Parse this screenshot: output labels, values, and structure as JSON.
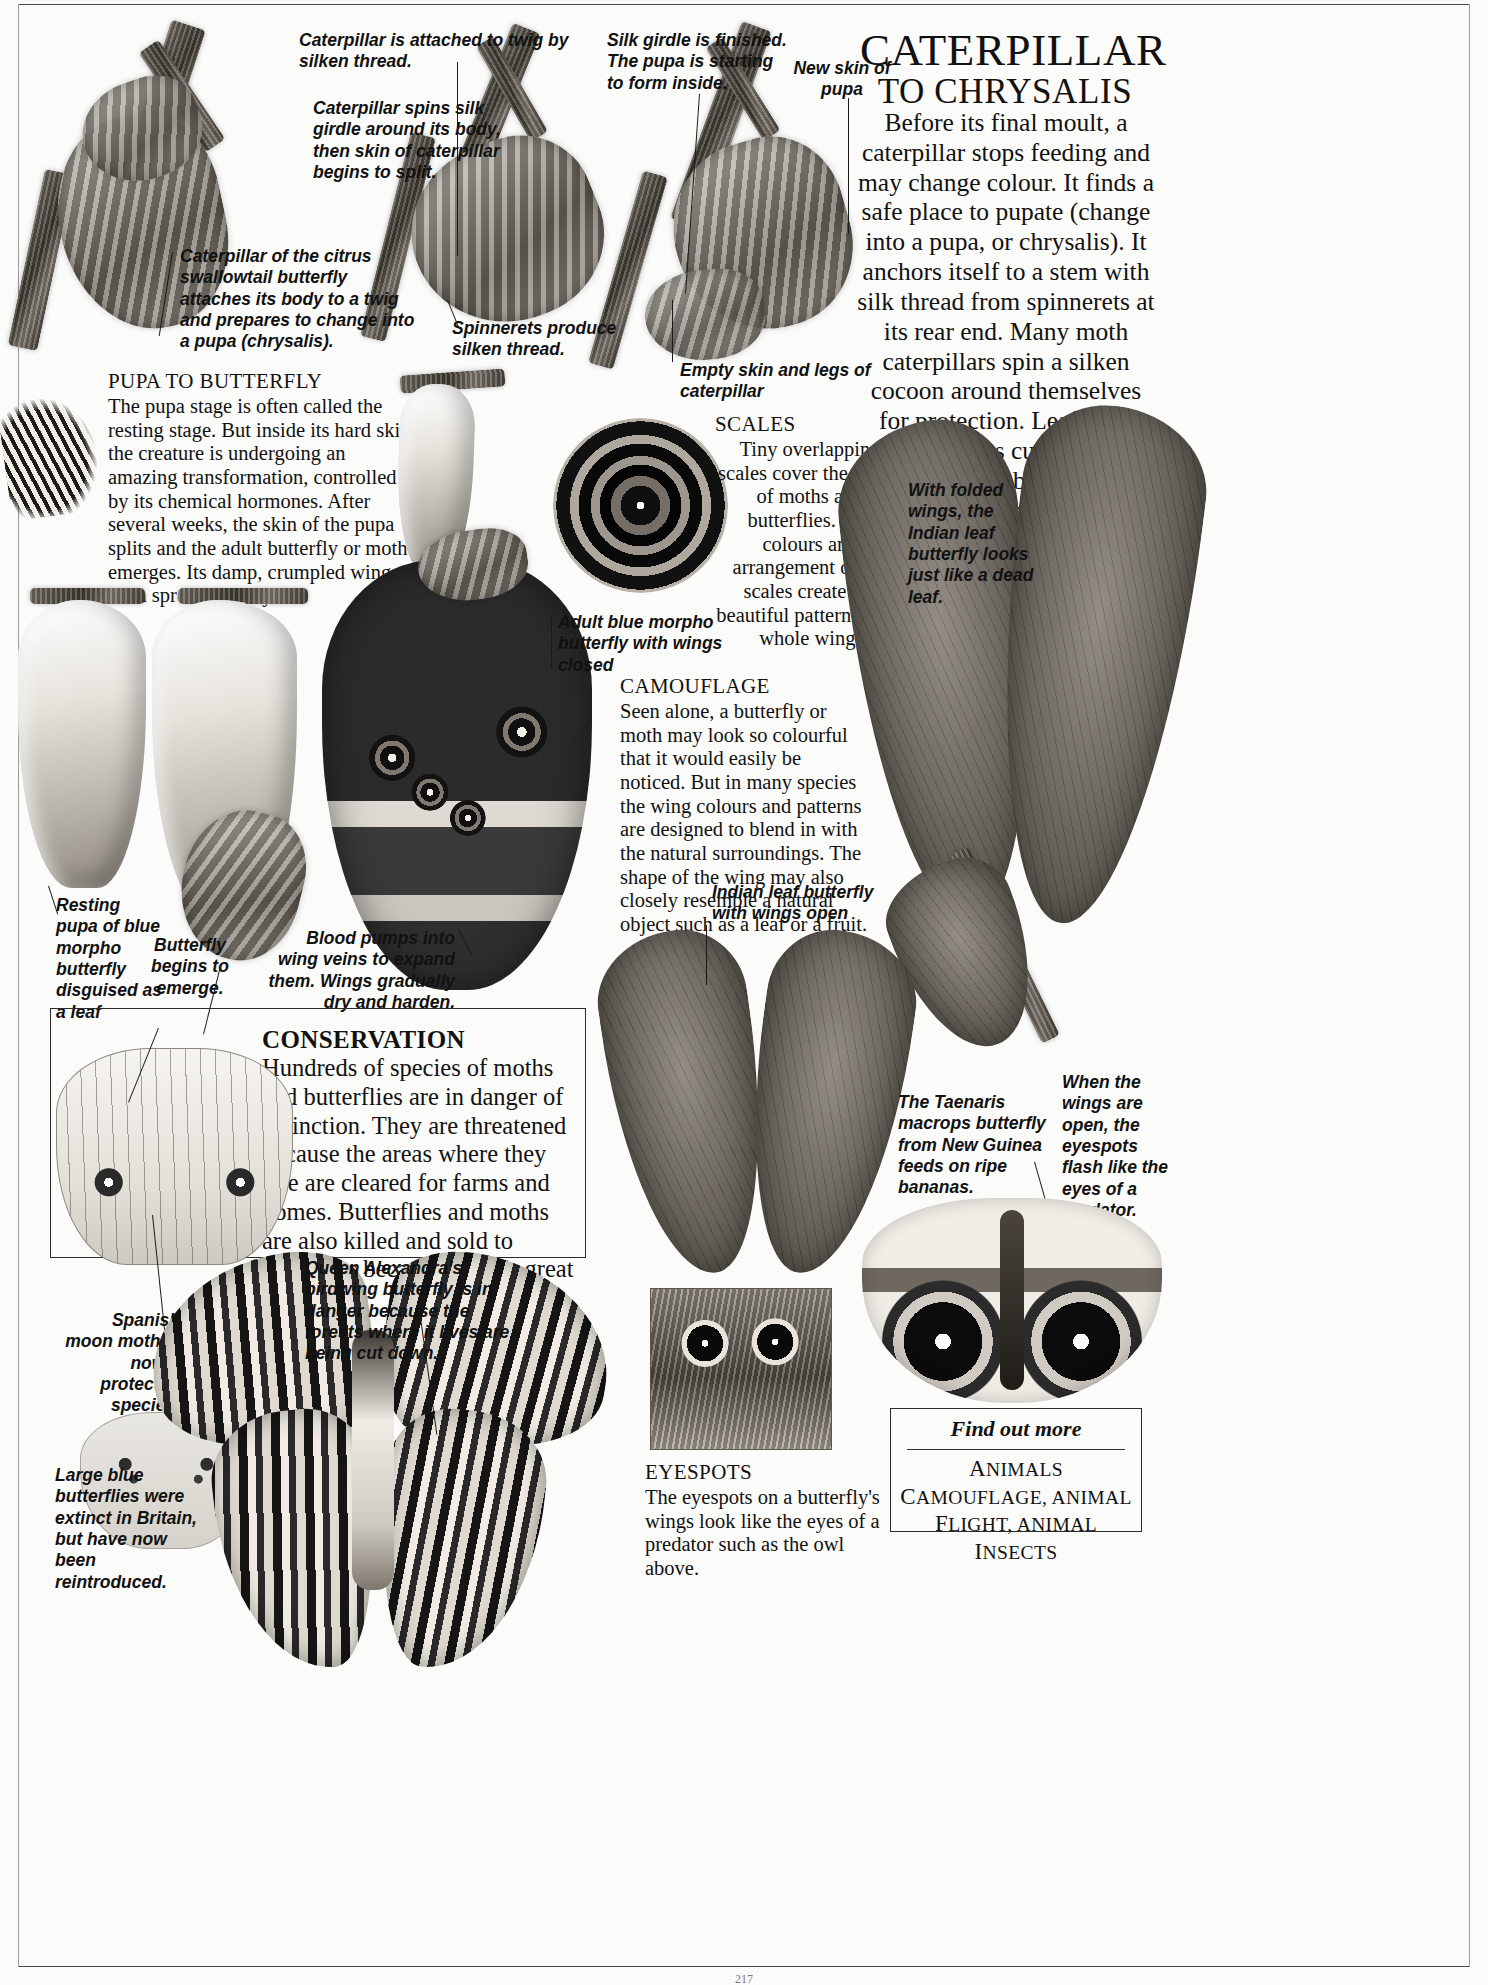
{
  "page": {
    "running_head": "LIFE CYCLES AND REPRODUCTION",
    "folio": "217"
  },
  "main_article": {
    "title_line1": "Caterpillar",
    "title_line2": "to Chrysalis",
    "intro": "Before its final moult, a caterpillar stops feeding and may change colour. It finds a safe place to pupate (change into a pupa, or chrysalis). It anchors itself to a stem with silk thread from spinnerets at its rear end. Many moth caterpillars spin a silken cocoon around themselves for protection. Leafroller caterpillars curl leaves around their bodies and, using their mandibles (mouthparts), stitch them together with silk."
  },
  "sections": [
    {
      "id": "pupa-to-butterfly",
      "heading": "PUPA TO BUTTERFLY",
      "body": "The pupa stage is often called the resting stage. But inside its hard skin the creature is undergoing an amazing transformation, controlled by its chemical hormones. After several weeks, the skin of the pupa splits and the adult butterfly or moth emerges. Its damp, crumpled wings soon spread and dry."
    },
    {
      "id": "scales",
      "heading": "SCALES",
      "body": "Tiny overlapping scales cover the wings of moths and butterflies. The colours and arrangement of the scales create the beautiful pattern of the whole wing."
    },
    {
      "id": "camouflage",
      "heading": "CAMOUFLAGE",
      "body": "Seen alone, a butterfly or moth may look so colourful that it would easily be noticed. But in many species the wing colours and patterns are designed to blend in with the natural surroundings. The shape of the wing may also closely resemble a natural object such as a leaf or a fruit."
    },
    {
      "id": "conservation",
      "heading": "CONSERVATION",
      "body": "Hundreds of species of moths and butterflies are in danger of extinction. They are threatened because the areas where they live are cleared for farms and homes. Butterflies and moths are also killed and sold to collectors because of their great beauty."
    },
    {
      "id": "eyespots",
      "heading": "EYESPOTS",
      "body": "The eyespots on a butterfly's wings look like the eyes of a predator such as the owl above."
    }
  ],
  "captions": {
    "attached_to_twig": "Caterpillar is attached to twig by silken thread.",
    "spins_girdle": "Caterpillar spins silk girdle around its body, then skin of caterpillar begins to split.",
    "citrus_swallowtail": "Caterpillar of the citrus swallowtail butterfly attaches its body to a twig and prepares to change into a pupa (chrysalis).",
    "spinnerets": "Spinnerets produce silken thread.",
    "silk_girdle_finished": "Silk girdle is finished. The pupa is starting to form inside.",
    "new_skin": "New skin of pupa",
    "empty_skin": "Empty skin and legs of caterpillar",
    "indian_leaf_folded": "With folded wings, the Indian leaf butterfly looks just like a dead leaf.",
    "adult_blue_morpho": "Adult blue morpho butterfly with wings closed",
    "resting_pupa": "Resting pupa of blue morpho butterfly disguised as a leaf",
    "butterfly_emerges": "Butterfly begins to emerge.",
    "blood_pumps": "Blood pumps into wing veins to expand them. Wings gradually dry and harden.",
    "indian_leaf_open": "Indian leaf butterfly with wings open",
    "taenaris": "The Taenaris macrops butterfly from New Guinea feeds on ripe bananas.",
    "eyespots_flash": "When the wings are open, the eyespots flash like the eyes of a predator.",
    "queen_alexandra": "Queen Alexandra's birdwing butterfly is in danger because the forests where it lives are being cut down.",
    "spanish_moon_moth": "Spanish moon moth is now a protected species.",
    "large_blue": "Large blue butterflies were extinct in Britain, but have now been reintroduced."
  },
  "find_out_more": {
    "title": "Find out more",
    "items": [
      "Animals",
      "Camouflage, animal",
      "Flight, animal",
      "Insects"
    ]
  }
}
